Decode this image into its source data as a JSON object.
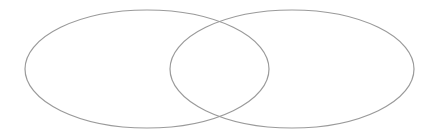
{
  "diagram": {
    "type": "venn",
    "stroke_color": "#9a9a9a",
    "background": "#ffffff",
    "sets": [
      {
        "name": "left-set",
        "cx": 147,
        "cy": 69,
        "rx": 122,
        "ry": 59
      },
      {
        "name": "right-set",
        "cx": 292,
        "cy": 69,
        "rx": 122,
        "ry": 59
      }
    ]
  }
}
